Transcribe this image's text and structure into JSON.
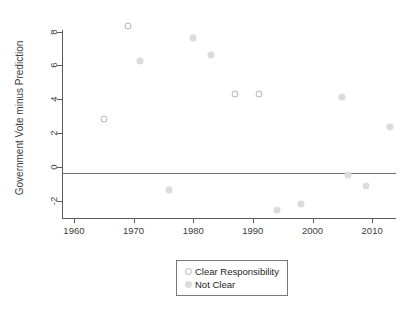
{
  "chart_data": {
    "type": "scatter",
    "title": "",
    "xlabel": "",
    "ylabel": "Government Vote minus Prediction",
    "xlim": [
      1958,
      2014
    ],
    "ylim": [
      -3.0,
      8.8
    ],
    "xticks": [
      1960,
      1970,
      1980,
      1990,
      2000,
      2010
    ],
    "yticks": [
      8,
      6,
      4,
      2,
      0,
      -2
    ],
    "grid": false,
    "reference_line": {
      "y": 0,
      "orientation": "horizontal",
      "color": "#6e6e6e"
    },
    "legend": {
      "position": "below-axes-center",
      "entries": [
        {
          "label": "Clear Responsibility",
          "marker": "open-circle",
          "color": "#b4b4b4"
        },
        {
          "label": "Not Clear",
          "marker": "filled-circle",
          "color": "#dcdcdc"
        }
      ]
    },
    "series": [
      {
        "name": "Clear Responsibility",
        "marker": "open-circle",
        "points": [
          {
            "x": 1965,
            "y": 2.85
          },
          {
            "x": 1969,
            "y": 8.3
          },
          {
            "x": 1987,
            "y": 4.3
          },
          {
            "x": 1991,
            "y": 4.3
          }
        ]
      },
      {
        "name": "Not Clear",
        "marker": "filled-circle",
        "points": [
          {
            "x": 1971,
            "y": 6.25
          },
          {
            "x": 1976,
            "y": -1.35
          },
          {
            "x": 1980,
            "y": 7.6
          },
          {
            "x": 1983,
            "y": 6.6
          },
          {
            "x": 1994,
            "y": -2.55
          },
          {
            "x": 1998,
            "y": -2.2
          },
          {
            "x": 2005,
            "y": 4.15
          },
          {
            "x": 2006,
            "y": -0.45
          },
          {
            "x": 2009,
            "y": -1.1
          },
          {
            "x": 2013,
            "y": 2.35
          }
        ]
      }
    ]
  }
}
